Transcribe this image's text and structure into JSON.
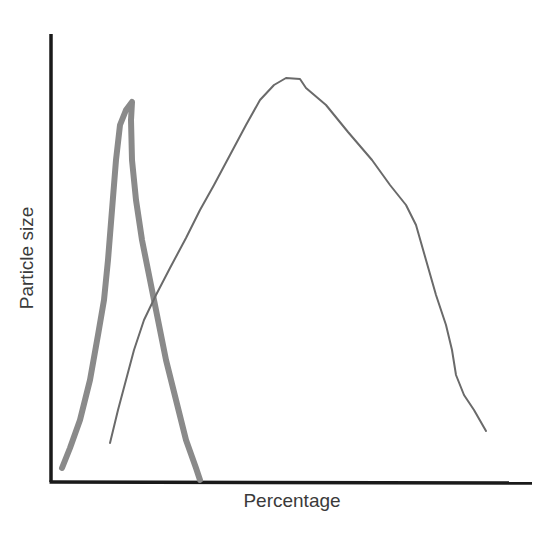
{
  "chart_data": {
    "type": "line",
    "title": "",
    "xlabel": "Percentage",
    "ylabel": "Particle size",
    "grid": false,
    "legend": null,
    "axis_ticks": "none",
    "series": [
      {
        "name": "narrow-distribution",
        "style": "thick",
        "color": "#8a8a8a",
        "points_px": [
          [
            62,
            468
          ],
          [
            70,
            448
          ],
          [
            80,
            420
          ],
          [
            90,
            380
          ],
          [
            98,
            335
          ],
          [
            104,
            300
          ],
          [
            108,
            260
          ],
          [
            112,
            210
          ],
          [
            116,
            160
          ],
          [
            120,
            125
          ],
          [
            126,
            110
          ],
          [
            132,
            102
          ],
          [
            131,
            120
          ],
          [
            132,
            160
          ],
          [
            136,
            200
          ],
          [
            142,
            240
          ],
          [
            150,
            280
          ],
          [
            158,
            320
          ],
          [
            166,
            360
          ],
          [
            176,
            400
          ],
          [
            186,
            440
          ],
          [
            196,
            468
          ],
          [
            200,
            480
          ]
        ]
      },
      {
        "name": "broad-distribution",
        "style": "thin",
        "color": "#6a6a6a",
        "points_px": [
          [
            110,
            443
          ],
          [
            118,
            410
          ],
          [
            126,
            380
          ],
          [
            134,
            350
          ],
          [
            144,
            320
          ],
          [
            156,
            295
          ],
          [
            170,
            268
          ],
          [
            186,
            238
          ],
          [
            200,
            210
          ],
          [
            214,
            185
          ],
          [
            230,
            155
          ],
          [
            246,
            125
          ],
          [
            260,
            100
          ],
          [
            274,
            85
          ],
          [
            286,
            78
          ],
          [
            300,
            79
          ],
          [
            306,
            88
          ],
          [
            326,
            105
          ],
          [
            348,
            132
          ],
          [
            372,
            160
          ],
          [
            390,
            185
          ],
          [
            406,
            205
          ],
          [
            416,
            225
          ],
          [
            426,
            260
          ],
          [
            436,
            295
          ],
          [
            446,
            325
          ],
          [
            452,
            350
          ],
          [
            456,
            375
          ],
          [
            464,
            395
          ],
          [
            474,
            410
          ],
          [
            486,
            431
          ]
        ]
      }
    ]
  },
  "labels": {
    "x_axis": "Percentage",
    "y_axis": "Particle size"
  },
  "colors": {
    "axis": "#1a1a1a",
    "thick_curve": "#8a8a8a",
    "thin_curve": "#6a6a6a",
    "text": "#3a3a3a"
  }
}
